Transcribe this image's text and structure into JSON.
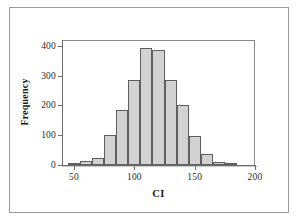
{
  "chart_data": {
    "type": "bar",
    "title": "",
    "subtitle": "",
    "xlabel": "CI",
    "ylabel": "Frequency",
    "xlim": [
      40,
      200
    ],
    "ylim": [
      0,
      420
    ],
    "grid": false,
    "legend": null,
    "bin_width": 10,
    "x_ticks": [
      50,
      100,
      150,
      200
    ],
    "x_tick_labels": [
      "50",
      "100",
      "150",
      "200"
    ],
    "y_ticks": [
      0,
      100,
      200,
      300,
      400
    ],
    "y_tick_labels": [
      "0",
      "100",
      "200",
      "300",
      "400"
    ],
    "categories": [
      "45-55",
      "55-65",
      "65-75",
      "75-85",
      "85-95",
      "95-105",
      "105-115",
      "115-125",
      "125-135",
      "135-145",
      "145-155",
      "155-165",
      "165-175",
      "175-185"
    ],
    "bin_starts": [
      45,
      55,
      65,
      75,
      85,
      95,
      105,
      115,
      125,
      135,
      145,
      155,
      165,
      175
    ],
    "bin_ends": [
      55,
      65,
      75,
      85,
      95,
      105,
      115,
      125,
      135,
      145,
      155,
      165,
      175,
      185
    ],
    "values": [
      5,
      14,
      24,
      101,
      186,
      287,
      394,
      387,
      286,
      201,
      98,
      38,
      10,
      4
    ],
    "series": [
      {
        "name": "Frequency",
        "values": [
          5,
          14,
          24,
          101,
          186,
          287,
          394,
          387,
          286,
          201,
          98,
          38,
          10,
          4
        ]
      }
    ],
    "colors": {
      "bar_fill": "#d2d2d2",
      "bar_edge": "#5f5f5f",
      "axis": "#6e6e6e",
      "text": "#1a1a1a",
      "background": "#ffffff",
      "outer_frame": "#9b9b9b"
    }
  }
}
